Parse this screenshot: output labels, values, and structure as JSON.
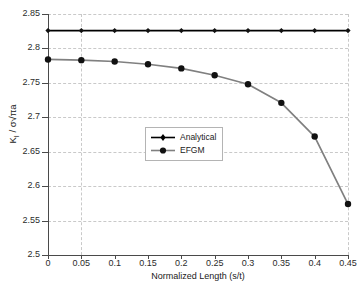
{
  "chart_data": {
    "type": "line",
    "title": "",
    "xlabel": "Normalized Length (s/t)",
    "ylabel": "K_I / σ√πa",
    "xlim": [
      0,
      0.45
    ],
    "ylim": [
      2.5,
      2.85
    ],
    "xticks": [
      "0",
      "0.05",
      "0.1",
      "0.15",
      "0.2",
      "0.25",
      "0.3",
      "0.35",
      "0.4",
      "0.45"
    ],
    "xtick_values": [
      0,
      0.05,
      0.1,
      0.15,
      0.2,
      0.25,
      0.3,
      0.35,
      0.4,
      0.45
    ],
    "yticks": [
      "2.5",
      "2.55",
      "2.6",
      "2.65",
      "2.7",
      "2.75",
      "2.8",
      "2.85"
    ],
    "ytick_values": [
      2.5,
      2.55,
      2.6,
      2.65,
      2.7,
      2.75,
      2.8,
      2.85
    ],
    "grid": true,
    "grid_horizontal_at": [
      2.55,
      2.6,
      2.65,
      2.7,
      2.75,
      2.8,
      2.85
    ],
    "grid_vertical_at": [
      0.05,
      0.45
    ],
    "legend_position": "center",
    "x": [
      0,
      0.05,
      0.1,
      0.15,
      0.2,
      0.25,
      0.3,
      0.35,
      0.4,
      0.45
    ],
    "series": [
      {
        "name": "Analytical",
        "color": "#000000",
        "marker": "diamond",
        "values": [
          2.826,
          2.826,
          2.826,
          2.826,
          2.826,
          2.826,
          2.826,
          2.826,
          2.826,
          2.826
        ]
      },
      {
        "name": "EFGM",
        "color": "#808080",
        "marker": "circle",
        "values": [
          2.784,
          2.783,
          2.781,
          2.777,
          2.771,
          2.761,
          2.748,
          2.721,
          2.672,
          2.574
        ]
      }
    ]
  },
  "legend": {
    "items": [
      {
        "label": "Analytical"
      },
      {
        "label": "EFGM"
      }
    ]
  },
  "colors": {
    "analytical": "#000000",
    "efgm": "#808080",
    "grid": "#c9c9c9",
    "axis": "#4a4a4a",
    "background": "#ffffff"
  }
}
